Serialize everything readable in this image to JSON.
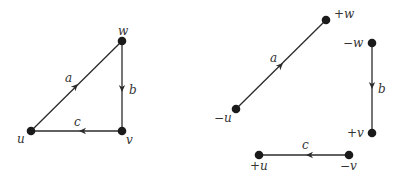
{
  "diagram": {
    "type": "graph-and-decomposition",
    "left_graph": {
      "name": "triangle",
      "nodes": [
        {
          "id": "w",
          "label": "w",
          "x": 122,
          "y": 41
        },
        {
          "id": "u",
          "label": "u",
          "x": 31,
          "y": 131
        },
        {
          "id": "v",
          "label": "v",
          "x": 122,
          "y": 131
        }
      ],
      "edges": [
        {
          "id": "a",
          "label": "a",
          "from": "u",
          "to": "w"
        },
        {
          "id": "b",
          "label": "b",
          "from": "w",
          "to": "v"
        },
        {
          "id": "c",
          "label": "c",
          "from": "v",
          "to": "u"
        }
      ]
    },
    "right_graph": {
      "name": "separated-edges",
      "nodes": [
        {
          "id": "pw",
          "label": "+w",
          "x": 326,
          "y": 20
        },
        {
          "id": "mu",
          "label": "−u",
          "x": 236,
          "y": 109
        },
        {
          "id": "mw",
          "label": "−w",
          "x": 372,
          "y": 43
        },
        {
          "id": "pv",
          "label": "+v",
          "x": 372,
          "y": 133
        },
        {
          "id": "pu",
          "label": "+u",
          "x": 259,
          "y": 155
        },
        {
          "id": "mv",
          "label": "−v",
          "x": 349,
          "y": 155
        }
      ],
      "edges": [
        {
          "id": "a",
          "label": "a",
          "from": "−u",
          "to": "+w"
        },
        {
          "id": "b",
          "label": "b",
          "from": "−w",
          "to": "+v"
        },
        {
          "id": "c",
          "label": "c",
          "from": "−v",
          "to": "+u"
        }
      ]
    }
  }
}
